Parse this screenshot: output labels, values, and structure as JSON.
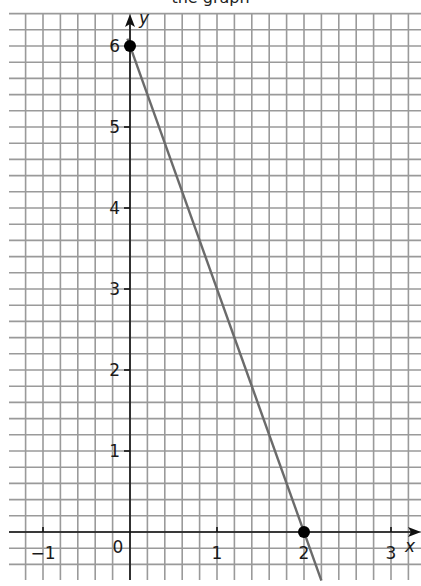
{
  "title": "the graph",
  "chart_data": {
    "type": "line",
    "title": "",
    "xlabel": "x",
    "ylabel": "y",
    "xlim": [
      -1.4,
      3.3
    ],
    "ylim": [
      -0.6,
      6.4
    ],
    "grid": true,
    "grid_minor_step": 0.2,
    "x_ticks": [
      -1,
      0,
      1,
      2,
      3
    ],
    "x_tick_labels": [
      "−1",
      "0",
      "1",
      "2",
      "3"
    ],
    "y_ticks": [
      1,
      2,
      3,
      4,
      5,
      6
    ],
    "y_tick_labels": [
      "1",
      "2",
      "3",
      "4",
      "5",
      "6"
    ],
    "series": [
      {
        "name": "y = 6 - 3x",
        "color": "#6b6b6b",
        "x": [
          -0.03,
          2.2
        ],
        "y": [
          6.09,
          -0.6
        ]
      }
    ],
    "points": [
      {
        "x": 0,
        "y": 6,
        "label": ""
      },
      {
        "x": 2,
        "y": 0,
        "label": ""
      }
    ]
  },
  "colors": {
    "grid": "#9a9a9a",
    "axis": "#111111",
    "line": "#6b6b6b",
    "point": "#000000"
  }
}
